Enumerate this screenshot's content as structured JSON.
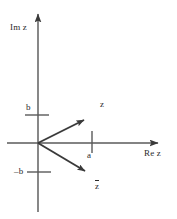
{
  "figure": {
    "stroke_color": "#3a3a3a",
    "text_color": "#2b2b2b",
    "background": "#ffffff",
    "width": 177,
    "height": 219
  },
  "axes": {
    "imaginary_label": "Im z",
    "real_label": "Re z",
    "origin": {
      "x": 38,
      "y": 143
    },
    "vertical_axis": {
      "x": 38,
      "y_top": 10,
      "y_bottom": 212
    },
    "horizontal_axis": {
      "y": 143,
      "x_left": 7,
      "x_right": 163
    }
  },
  "ticks": [
    {
      "name": "b",
      "label": "b",
      "axis": "imaginary",
      "value": "b",
      "x": 38,
      "y": 115
    },
    {
      "name": "minus-b",
      "label": "–b",
      "axis": "imaginary",
      "value": "-b",
      "x": 38,
      "y": 172
    },
    {
      "name": "a",
      "label": "a",
      "axis": "real",
      "value": "a",
      "x": 92,
      "y": 143
    }
  ],
  "vectors": [
    {
      "name": "z",
      "label": "z",
      "from": {
        "x": 38,
        "y": 143
      },
      "to": {
        "x": 90,
        "y": 117
      },
      "description": "vector from origin to point z = a + bi"
    },
    {
      "name": "z-conjugate",
      "label": "z̄",
      "label_base": "z",
      "from": {
        "x": 38,
        "y": 143
      },
      "to": {
        "x": 91,
        "y": 174
      },
      "description": "vector from origin to conjugate point z-bar = a - bi"
    }
  ]
}
